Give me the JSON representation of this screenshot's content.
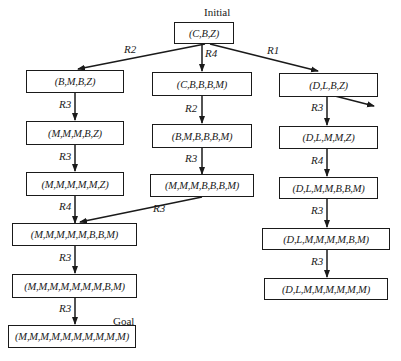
{
  "diagram": {
    "type": "search-tree",
    "annotations": {
      "initial": "Initial",
      "goal": "Goal"
    },
    "nodes": [
      {
        "id": "n0",
        "label": "(C,B,Z)"
      },
      {
        "id": "n1",
        "label": "(B,M,B,Z)"
      },
      {
        "id": "n2",
        "label": "(C,B,B,B,M)"
      },
      {
        "id": "n3",
        "label": "(D,L,B,Z)"
      },
      {
        "id": "n4",
        "label": "(M,M,M,B,Z)"
      },
      {
        "id": "n5",
        "label": "(B,M,B,B,B,M)"
      },
      {
        "id": "n6",
        "label": "(D,L,M,M,Z)"
      },
      {
        "id": "n7",
        "label": "(M,M,M,M,M,Z)"
      },
      {
        "id": "n8",
        "label": "(M,M,M,B,B,B,M)"
      },
      {
        "id": "n9",
        "label": "(D,L,M,M,B,B,M)"
      },
      {
        "id": "n10",
        "label": "(M,M,M,M,M,B,B,M)"
      },
      {
        "id": "n11",
        "label": "(D,L,M,M,M,M,B,M)"
      },
      {
        "id": "n12",
        "label": "(M,M,M,M,M,M,M,B,M)"
      },
      {
        "id": "n13",
        "label": "(D,L,M,M,M,M,M,M)"
      },
      {
        "id": "n14",
        "label": "(M,M,M,M,M,M,M,M,M,M)"
      }
    ],
    "edges": [
      {
        "from": "n0",
        "to": "n1",
        "rule": "R2"
      },
      {
        "from": "n0",
        "to": "n2",
        "rule": "R4"
      },
      {
        "from": "n0",
        "to": "n3",
        "rule": "R1"
      },
      {
        "from": "n1",
        "to": "n4",
        "rule": "R3"
      },
      {
        "from": "n2",
        "to": "n5",
        "rule": "R2"
      },
      {
        "from": "n3",
        "to": "n6",
        "rule": "R3"
      },
      {
        "from": "n3",
        "to": "offscreen",
        "rule": ""
      },
      {
        "from": "n4",
        "to": "n7",
        "rule": "R3"
      },
      {
        "from": "n5",
        "to": "n8",
        "rule": "R3"
      },
      {
        "from": "n6",
        "to": "n9",
        "rule": "R4"
      },
      {
        "from": "n7",
        "to": "n10",
        "rule": "R4"
      },
      {
        "from": "n8",
        "to": "n10",
        "rule": "R3"
      },
      {
        "from": "n9",
        "to": "n11",
        "rule": "R3"
      },
      {
        "from": "n10",
        "to": "n12",
        "rule": "R3"
      },
      {
        "from": "n11",
        "to": "n13",
        "rule": "R3"
      },
      {
        "from": "n12",
        "to": "n14",
        "rule": "R3"
      }
    ]
  }
}
